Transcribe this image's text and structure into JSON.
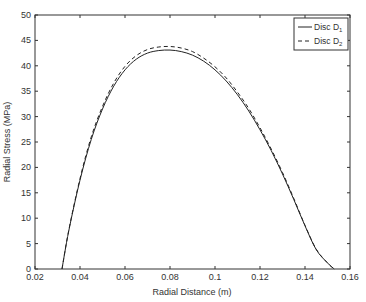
{
  "chart_data": {
    "type": "line",
    "title": "",
    "xlabel": "Radial Distance (m)",
    "ylabel": "Radial Stress (MPa)",
    "xlim": [
      0.02,
      0.16
    ],
    "ylim": [
      0,
      50
    ],
    "xticks": [
      0.02,
      0.04,
      0.06,
      0.08,
      0.1,
      0.12,
      0.14,
      0.16
    ],
    "xtick_labels": [
      "0.02",
      "0.04",
      "0.06",
      "0.08",
      "0.1",
      "0.12",
      "0.14",
      "0.16"
    ],
    "yticks": [
      0,
      5,
      10,
      15,
      20,
      25,
      30,
      35,
      40,
      45,
      50
    ],
    "ytick_labels": [
      "0",
      "5",
      "10",
      "15",
      "20",
      "25",
      "30",
      "35",
      "40",
      "45",
      "50"
    ],
    "grid": false,
    "legend_position": "upper right",
    "series": [
      {
        "name": "Disc D1",
        "label_main": "Disc D",
        "label_sub": "1",
        "style": "solid",
        "color": "#222222",
        "x": [
          0.032,
          0.035,
          0.04,
          0.045,
          0.05,
          0.055,
          0.06,
          0.065,
          0.07,
          0.075,
          0.08,
          0.085,
          0.09,
          0.095,
          0.1,
          0.105,
          0.11,
          0.115,
          0.12,
          0.125,
          0.13,
          0.135,
          0.14,
          0.145,
          0.15,
          0.153
        ],
        "y": [
          0,
          7.5,
          17.5,
          25.5,
          31.5,
          36,
          39.2,
          41.3,
          42.5,
          43,
          43.1,
          42.8,
          42.1,
          40.9,
          39.2,
          37,
          34.3,
          31.1,
          27.4,
          23.3,
          18.7,
          13.7,
          8.5,
          3.8,
          1.2,
          0
        ]
      },
      {
        "name": "Disc D2",
        "label_main": "Disc D",
        "label_sub": "2",
        "style": "dashed",
        "color": "#222222",
        "x": [
          0.032,
          0.035,
          0.04,
          0.045,
          0.05,
          0.055,
          0.06,
          0.065,
          0.07,
          0.075,
          0.08,
          0.085,
          0.09,
          0.095,
          0.1,
          0.105,
          0.11,
          0.115,
          0.12,
          0.125,
          0.13,
          0.135,
          0.14,
          0.145,
          0.15,
          0.153
        ],
        "y": [
          0,
          7.6,
          17.8,
          26,
          32,
          36.6,
          39.9,
          42,
          43.2,
          43.7,
          43.8,
          43.5,
          42.8,
          41.5,
          39.8,
          37.6,
          34.8,
          31.6,
          27.8,
          23.6,
          19,
          13.9,
          8.6,
          3.9,
          1.2,
          0
        ]
      }
    ]
  }
}
